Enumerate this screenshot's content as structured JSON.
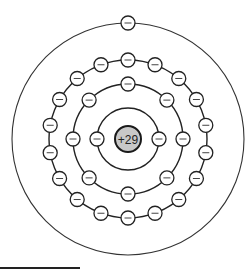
{
  "diagram": {
    "center": {
      "x": 128,
      "y": 139
    },
    "nucleus": {
      "label": "+29",
      "radius": 13,
      "fill": "#c8c8c8",
      "stroke": "#1a1a1a"
    },
    "electron": {
      "radius": 7,
      "symbol": "minus",
      "fill": "#ffffff",
      "stroke": "#222222"
    },
    "shells": [
      {
        "name": "shell-1",
        "radius": 31,
        "electrons": 2,
        "start_angle_deg": 0
      },
      {
        "name": "shell-2",
        "radius": 55,
        "electrons": 8,
        "start_angle_deg": 0
      },
      {
        "name": "shell-3",
        "radius": 79,
        "electrons": 18,
        "start_angle_deg": 10
      },
      {
        "name": "shell-4",
        "radius": 116,
        "electrons": 1,
        "start_angle_deg": 90,
        "outer": true
      }
    ],
    "electron_configuration": [
      2,
      8,
      18,
      1
    ]
  },
  "footer": {
    "rule": true
  }
}
